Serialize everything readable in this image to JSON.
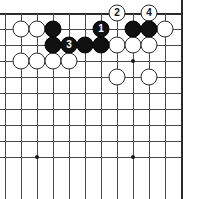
{
  "figure": {
    "kind": "go-board-diagram",
    "board": {
      "columns": 12,
      "rows": 10,
      "cell_size": 16,
      "origin_x": 5,
      "origin_y": 13,
      "line_color": "#4a4a4a",
      "edge_color": "#2b2b2b",
      "background_color": "#ffffff"
    },
    "star_points": [
      {
        "col": 8,
        "row": 3
      },
      {
        "col": 2,
        "row": 9
      },
      {
        "col": 8,
        "row": 9
      }
    ],
    "stones": [
      {
        "color": "white",
        "col": 1,
        "row": 1,
        "label": ""
      },
      {
        "color": "white",
        "col": 2,
        "row": 1,
        "label": ""
      },
      {
        "color": "black",
        "col": 3,
        "row": 1,
        "label": ""
      },
      {
        "color": "black",
        "col": 6,
        "row": 1,
        "label": "1"
      },
      {
        "color": "black",
        "col": 8,
        "row": 1,
        "label": ""
      },
      {
        "color": "black",
        "col": 9,
        "row": 1,
        "label": ""
      },
      {
        "color": "white",
        "col": 10,
        "row": 1,
        "label": ""
      },
      {
        "color": "black",
        "col": 3,
        "row": 2,
        "label": ""
      },
      {
        "color": "black",
        "col": 4,
        "row": 2,
        "label": "3"
      },
      {
        "color": "black",
        "col": 5,
        "row": 2,
        "label": ""
      },
      {
        "color": "black",
        "col": 6,
        "row": 2,
        "label": ""
      },
      {
        "color": "white",
        "col": 7,
        "row": 2,
        "label": ""
      },
      {
        "color": "white",
        "col": 8,
        "row": 2,
        "label": ""
      },
      {
        "color": "white",
        "col": 9,
        "row": 2,
        "label": ""
      },
      {
        "color": "white",
        "col": 1,
        "row": 3,
        "label": ""
      },
      {
        "color": "white",
        "col": 2,
        "row": 3,
        "label": ""
      },
      {
        "color": "white",
        "col": 3,
        "row": 3,
        "label": ""
      },
      {
        "color": "white",
        "col": 4,
        "row": 3,
        "label": ""
      },
      {
        "color": "white",
        "col": 7,
        "row": 4,
        "label": ""
      },
      {
        "color": "white",
        "col": 9,
        "row": 4,
        "label": ""
      }
    ],
    "edge_markers": [
      {
        "color": "white",
        "col": 7,
        "row": 0,
        "label": "2"
      },
      {
        "color": "white",
        "col": 9,
        "row": 0,
        "label": "4"
      }
    ],
    "move_sequence": [
      {
        "number": "1",
        "color": "black"
      },
      {
        "number": "2",
        "color": "white"
      },
      {
        "number": "3",
        "color": "black"
      },
      {
        "number": "4",
        "color": "white"
      }
    ]
  }
}
